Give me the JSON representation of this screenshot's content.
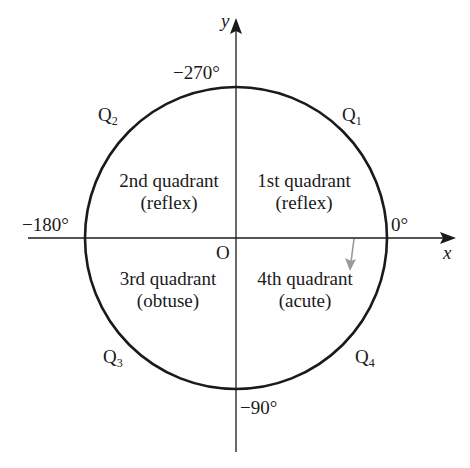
{
  "diagram": {
    "axes": {
      "x_label": "x",
      "y_label": "y",
      "origin_label": "O"
    },
    "angles": {
      "right": "0°",
      "top": "−270°",
      "left": "−180°",
      "bottom": "−90°"
    },
    "points": {
      "q1": {
        "letter": "Q",
        "sub": "1"
      },
      "q2": {
        "letter": "Q",
        "sub": "2"
      },
      "q3": {
        "letter": "Q",
        "sub": "3"
      },
      "q4": {
        "letter": "Q",
        "sub": "4"
      }
    },
    "quadrants": {
      "first": {
        "name": "1st quadrant",
        "type": "(reflex)"
      },
      "second": {
        "name": "2nd quadrant",
        "type": "(reflex)"
      },
      "third": {
        "name": "3rd quadrant",
        "type": "(obtuse)"
      },
      "fourth": {
        "name": "4th quadrant",
        "type": "(acute)"
      }
    },
    "colors": {
      "line": "#1a1a1a",
      "rotation_arrow": "#9a9a9a",
      "background": "#ffffff"
    }
  }
}
